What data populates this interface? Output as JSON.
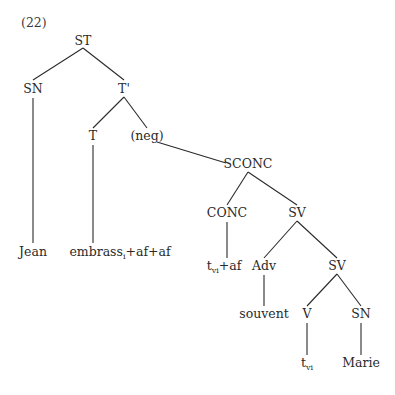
{
  "example_number": "(22)",
  "tree": {
    "nodes": [
      {
        "id": "ST",
        "label": "ST"
      },
      {
        "id": "SN1",
        "label": "SN"
      },
      {
        "id": "Tbar",
        "label": "T'"
      },
      {
        "id": "T",
        "label": "T"
      },
      {
        "id": "neg",
        "label": "(neg)"
      },
      {
        "id": "SCONC",
        "label": "SCONC"
      },
      {
        "id": "CONC",
        "label": "CONC"
      },
      {
        "id": "SV1",
        "label": "SV"
      },
      {
        "id": "Adv",
        "label": "Adv"
      },
      {
        "id": "SV2",
        "label": "SV"
      },
      {
        "id": "V",
        "label": "V"
      },
      {
        "id": "SN2",
        "label": "SN"
      },
      {
        "id": "Jean",
        "label": "Jean"
      },
      {
        "id": "embrass",
        "label": "embrass",
        "subscript": "i",
        "suffix": "+af+af"
      },
      {
        "id": "tvi_af",
        "label": "t",
        "subscript": "vi",
        "suffix": "+af"
      },
      {
        "id": "souvent",
        "label": "souvent"
      },
      {
        "id": "tvi",
        "label": "t",
        "subscript": "vi"
      },
      {
        "id": "Marie",
        "label": "Marie"
      }
    ],
    "edges": [
      [
        "ST",
        "SN1"
      ],
      [
        "ST",
        "Tbar"
      ],
      [
        "SN1",
        "Jean"
      ],
      [
        "Tbar",
        "T"
      ],
      [
        "Tbar",
        "neg"
      ],
      [
        "T",
        "embrass"
      ],
      [
        "neg",
        "SCONC"
      ],
      [
        "SCONC",
        "CONC"
      ],
      [
        "SCONC",
        "SV1"
      ],
      [
        "CONC",
        "tvi_af"
      ],
      [
        "SV1",
        "Adv"
      ],
      [
        "SV1",
        "SV2"
      ],
      [
        "Adv",
        "souvent"
      ],
      [
        "SV2",
        "V"
      ],
      [
        "SV2",
        "SN2"
      ],
      [
        "V",
        "tvi"
      ],
      [
        "SN2",
        "Marie"
      ]
    ]
  }
}
